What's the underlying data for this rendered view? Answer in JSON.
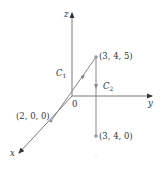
{
  "diagram": {
    "type": "3d-coordinate-paths",
    "colors": {
      "axis": "#444444",
      "path": "#777777",
      "point": "#999999",
      "text": "#333333"
    },
    "axes": {
      "x_label": "x",
      "y_label": "y",
      "z_label": "z",
      "origin_label": "0"
    },
    "points": [
      {
        "id": "p200",
        "label": "(2, 0, 0)"
      },
      {
        "id": "p345",
        "label": "(3, 4, 5)"
      },
      {
        "id": "p340",
        "label": "(3, 4, 0)"
      }
    ],
    "curves": [
      {
        "id": "c1",
        "name": "C",
        "subscript": "1",
        "from": "(2, 0, 0)",
        "to": "(3, 4, 5)"
      },
      {
        "id": "c2",
        "name": "C",
        "subscript": "2",
        "from": "(3, 4, 5)",
        "to": "(3, 4, 0)"
      }
    ]
  }
}
